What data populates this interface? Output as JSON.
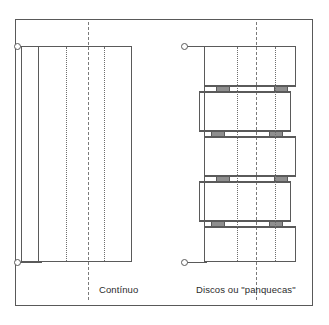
{
  "figure": {
    "kind": "technical-diagram",
    "frame": {
      "x": 15,
      "y": 19,
      "width": 298,
      "height": 287
    },
    "line_color": "#5a5a5a",
    "dash_color": "#7a7a7a",
    "spacer_color": "#8f8f8f",
    "background": "#ffffff"
  },
  "left_diagram": {
    "caption": "Contínuo",
    "caption_x": 99,
    "caption_y": 284,
    "body": {
      "x": 21,
      "y": 46,
      "width": 111,
      "height": 216
    },
    "inner_solid_line_x": 38,
    "dotted_lines_x": [
      66,
      104
    ],
    "center_dash_x": 88,
    "center_dash_top": 22,
    "center_dash_bottom": 300,
    "terminals": [
      {
        "name": "top-terminal",
        "cx": 18,
        "cy": 46
      },
      {
        "name": "bottom-terminal",
        "cx": 18,
        "cy": 262
      }
    ],
    "leads": [
      {
        "name": "top-lead",
        "x1": 18,
        "x2": 40,
        "y": 46
      },
      {
        "name": "bottom-lead",
        "x1": 18,
        "x2": 40,
        "y": 262
      }
    ]
  },
  "right_diagram": {
    "caption": "Discos ou \"panquecas\"",
    "caption_x": 196,
    "caption_y": 284,
    "dotted_lines_x": [
      237,
      275
    ],
    "center_dash_x": 256,
    "center_dash_top": 22,
    "center_dash_bottom": 300,
    "discs": [
      {
        "index": 1,
        "x": 204,
        "y": 46,
        "width": 92,
        "height": 40
      },
      {
        "index": 2,
        "x": 199,
        "y": 91,
        "width": 92,
        "height": 40
      },
      {
        "index": 3,
        "x": 204,
        "y": 136,
        "width": 92,
        "height": 40
      },
      {
        "index": 4,
        "x": 199,
        "y": 181,
        "width": 92,
        "height": 40
      },
      {
        "index": 5,
        "x": 204,
        "y": 226,
        "width": 92,
        "height": 36
      }
    ],
    "spacer_rows": [
      {
        "index": 1,
        "y": 86,
        "height": 6,
        "blocks": [
          {
            "x": 216,
            "width": 14
          },
          {
            "x": 274,
            "width": 14
          }
        ]
      },
      {
        "index": 2,
        "y": 131,
        "height": 6,
        "blocks": [
          {
            "x": 211,
            "width": 14
          },
          {
            "x": 269,
            "width": 14
          }
        ]
      },
      {
        "index": 3,
        "y": 176,
        "height": 6,
        "blocks": [
          {
            "x": 216,
            "width": 14
          },
          {
            "x": 274,
            "width": 14
          }
        ]
      },
      {
        "index": 4,
        "y": 221,
        "height": 6,
        "blocks": [
          {
            "x": 211,
            "width": 14
          },
          {
            "x": 269,
            "width": 14
          }
        ]
      }
    ],
    "terminals": [
      {
        "name": "top-terminal",
        "cx": 185,
        "cy": 46
      },
      {
        "name": "bottom-terminal",
        "cx": 185,
        "cy": 262
      }
    ],
    "leads": [
      {
        "name": "top-lead",
        "x1": 185,
        "x2": 206,
        "y": 46
      },
      {
        "name": "bottom-lead",
        "x1": 185,
        "x2": 206,
        "y": 262
      }
    ],
    "riser": {
      "x": 204,
      "y1": 46,
      "y2": 262
    }
  }
}
